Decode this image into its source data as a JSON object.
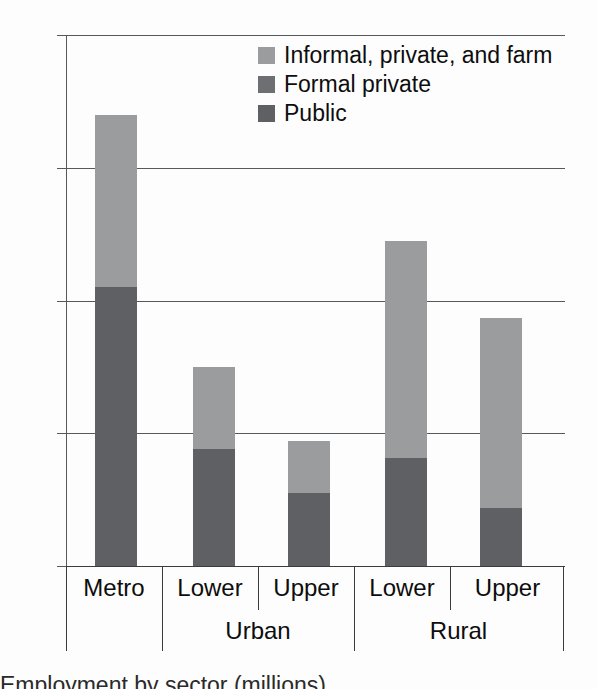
{
  "chart_data": {
    "type": "bar",
    "subtype": "stacked-vertical",
    "title": "",
    "xlabel": "",
    "ylabel": "",
    "ylim": [
      0,
      8
    ],
    "yticks": [
      "0",
      "2",
      "4",
      "6",
      "8"
    ],
    "ytick_values": [
      0,
      2,
      4,
      6,
      8
    ],
    "grid": true,
    "legend_position": "top-center",
    "categories": [
      "Metro",
      "Lower",
      "Upper",
      "Lower",
      "Upper"
    ],
    "groups": [
      {
        "label": "",
        "categories": [
          "Metro"
        ]
      },
      {
        "label": "Urban",
        "categories": [
          "Lower",
          "Upper"
        ]
      },
      {
        "label": "Rural",
        "categories": [
          "Lower",
          "Upper"
        ]
      }
    ],
    "series": [
      {
        "name": "Public",
        "color": "#5f6063",
        "values": [
          4.2,
          1.77,
          1.1,
          1.62,
          0.88
        ]
      },
      {
        "name": "Formal private",
        "color": "#6e6f72",
        "values": [
          0,
          0,
          0,
          0,
          0
        ]
      },
      {
        "name": "Informal, private, and farm",
        "color": "#9b9c9e",
        "values": [
          2.6,
          1.23,
          0.78,
          3.28,
          2.85
        ]
      }
    ],
    "totals": [
      6.8,
      3.0,
      1.88,
      4.9,
      3.73
    ]
  },
  "axis": {
    "y_ticks": [
      {
        "label": "8",
        "value": 8
      },
      {
        "label": "6",
        "value": 6
      },
      {
        "label": "4",
        "value": 4
      },
      {
        "label": "2",
        "value": 2
      },
      {
        "label": "0",
        "value": 0
      }
    ]
  },
  "x_axis": {
    "cells": [
      {
        "label": "Metro"
      },
      {
        "label": "Lower"
      },
      {
        "label": "Upper"
      },
      {
        "label": "Lower"
      },
      {
        "label": "Upper"
      }
    ],
    "groups": [
      {
        "label": ""
      },
      {
        "label": "Urban"
      },
      {
        "label": "Rural"
      }
    ]
  },
  "legend": {
    "items": [
      {
        "label": "Informal, private, and farm",
        "color": "#9b9c9e"
      },
      {
        "label": "Formal private",
        "color": "#6e6f72"
      },
      {
        "label": "Public",
        "color": "#5f6063"
      }
    ]
  },
  "caption": {
    "text": "Employment by sector (millions)"
  }
}
